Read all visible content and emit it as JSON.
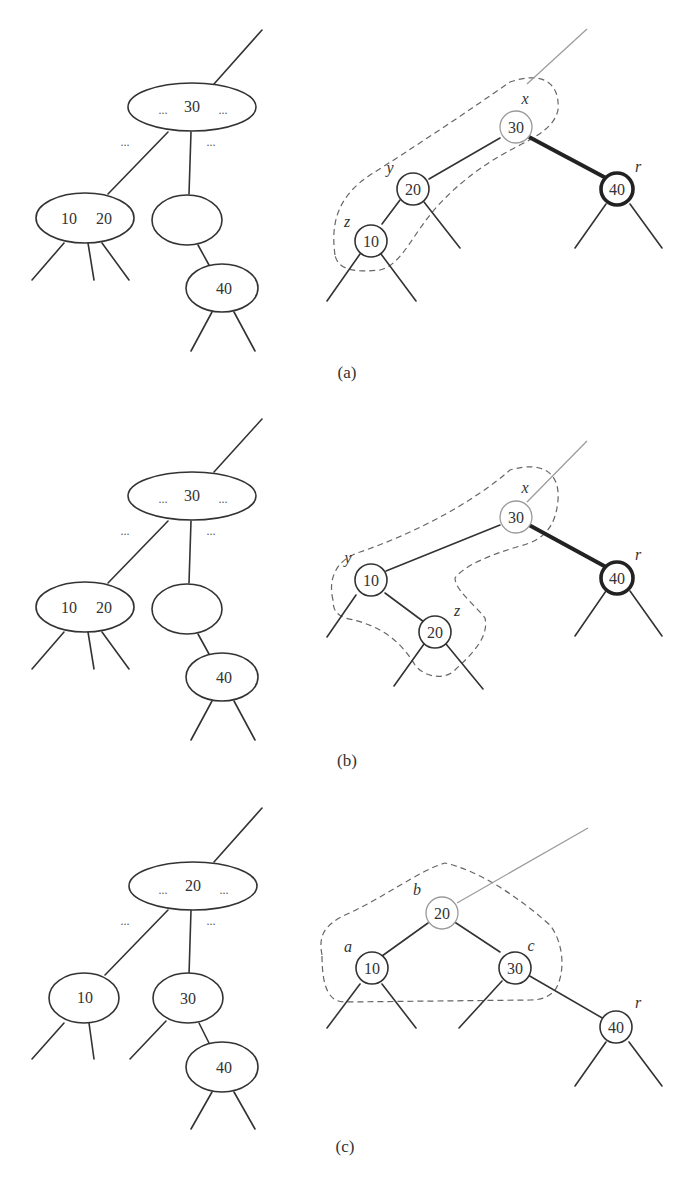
{
  "figure": {
    "panels": [
      {
        "caption": "(a)",
        "btree": {
          "root": {
            "left_dots": "...",
            "key": "30",
            "right_dots": "..."
          },
          "edge_dots_left": "...",
          "edge_dots_right": "...",
          "left_child": {
            "keys": [
              "10",
              "20"
            ]
          },
          "middle_child": {
            "keys": []
          },
          "grandchild": {
            "key": "40"
          }
        },
        "rbtree": {
          "nodes": [
            {
              "key": "30",
              "label": "x",
              "color": "red"
            },
            {
              "key": "20",
              "label": "y",
              "color": "black"
            },
            {
              "key": "10",
              "label": "z",
              "color": "black"
            },
            {
              "key": "40",
              "label": "r",
              "color": "black-bold"
            }
          ]
        }
      },
      {
        "caption": "(b)",
        "btree": {
          "root": {
            "left_dots": "...",
            "key": "30",
            "right_dots": "..."
          },
          "edge_dots_left": "...",
          "edge_dots_right": "...",
          "left_child": {
            "keys": [
              "10",
              "20"
            ]
          },
          "middle_child": {
            "keys": []
          },
          "grandchild": {
            "key": "40"
          }
        },
        "rbtree": {
          "nodes": [
            {
              "key": "30",
              "label": "x",
              "color": "red"
            },
            {
              "key": "10",
              "label": "y",
              "color": "black"
            },
            {
              "key": "20",
              "label": "z",
              "color": "black"
            },
            {
              "key": "40",
              "label": "r",
              "color": "black-bold"
            }
          ]
        }
      },
      {
        "caption": "(c)",
        "btree": {
          "root": {
            "left_dots": "...",
            "key": "20",
            "right_dots": "..."
          },
          "edge_dots_left": "...",
          "edge_dots_right": "...",
          "left_child": {
            "keys": [
              "10"
            ]
          },
          "middle_child": {
            "keys": [
              "30"
            ]
          },
          "grandchild": {
            "key": "40"
          }
        },
        "rbtree": {
          "nodes": [
            {
              "key": "20",
              "label": "b",
              "color": "red"
            },
            {
              "key": "10",
              "label": "a",
              "color": "black"
            },
            {
              "key": "30",
              "label": "c",
              "color": "black"
            },
            {
              "key": "40",
              "label": "r",
              "color": "black"
            }
          ]
        }
      }
    ],
    "colors": {
      "red_node_stroke": "#9a9a9a",
      "black_node_stroke": "#333333",
      "bold_node_stroke": "#222222",
      "region_stroke": "#666666"
    }
  }
}
